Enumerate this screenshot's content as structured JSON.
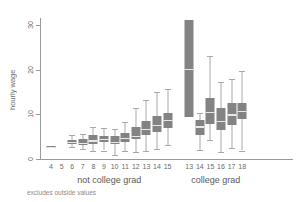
{
  "chart_data": {
    "type": "box",
    "title": "",
    "xlabel": "",
    "ylabel": "hourly wage",
    "ylim": [
      0,
      32
    ],
    "y_ticks": [
      0,
      10,
      20,
      30
    ],
    "grid": false,
    "legend": "none",
    "footnote": "excludes outside values",
    "group_labels": [
      "not college grad",
      "college grad"
    ],
    "groups": [
      {
        "name": "not college grad",
        "categories": [
          "4",
          "5",
          "6",
          "7",
          "8",
          "9",
          "10",
          "11",
          "12",
          "13",
          "14",
          "15"
        ],
        "boxes": [
          {
            "category": "4",
            "present": true,
            "whisker_low": 2.6,
            "q1": 2.6,
            "median": 2.7,
            "q3": 2.8,
            "whisker_high": 2.8
          },
          {
            "category": "5",
            "present": false,
            "whisker_low": null,
            "q1": null,
            "median": null,
            "q3": null,
            "whisker_high": null
          },
          {
            "category": "6",
            "present": true,
            "whisker_low": 2.7,
            "q1": 3.4,
            "median": 3.8,
            "q3": 4.3,
            "whisker_high": 5.3
          },
          {
            "category": "7",
            "present": true,
            "whisker_low": 2.3,
            "q1": 3.2,
            "median": 3.6,
            "q3": 4.4,
            "whisker_high": 5.6
          },
          {
            "category": "8",
            "present": true,
            "whisker_low": 1.8,
            "q1": 3.3,
            "median": 4.2,
            "q3": 5.4,
            "whisker_high": 7.2
          },
          {
            "category": "9",
            "present": true,
            "whisker_low": 1.9,
            "q1": 3.7,
            "median": 4.5,
            "q3": 5.2,
            "whisker_high": 6.9
          },
          {
            "category": "10",
            "present": true,
            "whisker_low": 1.0,
            "q1": 3.3,
            "median": 3.9,
            "q3": 5.1,
            "whisker_high": 6.6
          },
          {
            "category": "11",
            "present": true,
            "whisker_low": 1.7,
            "q1": 3.9,
            "median": 4.7,
            "q3": 5.9,
            "whisker_high": 8.2
          },
          {
            "category": "12",
            "present": true,
            "whisker_low": 1.6,
            "q1": 4.5,
            "median": 5.2,
            "q3": 7.2,
            "whisker_high": 11.5
          },
          {
            "category": "13",
            "present": true,
            "whisker_low": 1.7,
            "q1": 5.4,
            "median": 6.8,
            "q3": 8.6,
            "whisker_high": 13.2
          },
          {
            "category": "14",
            "present": true,
            "whisker_low": 2.3,
            "q1": 6.1,
            "median": 7.6,
            "q3": 9.7,
            "whisker_high": 14.9
          },
          {
            "category": "15",
            "present": true,
            "whisker_low": 3.1,
            "q1": 6.9,
            "median": 8.8,
            "q3": 10.3,
            "whisker_high": 15.6
          }
        ]
      },
      {
        "name": "college grad",
        "categories": [
          "13",
          "14",
          "15",
          "16",
          "17",
          "18"
        ],
        "boxes": [
          {
            "category": "13",
            "present": true,
            "whisker_low": 9.5,
            "q1": 9.5,
            "median": 20.2,
            "q3": 31.0,
            "whisker_high": 31.0
          },
          {
            "category": "14",
            "present": true,
            "whisker_low": 2.0,
            "q1": 5.4,
            "median": 7.3,
            "q3": 8.8,
            "whisker_high": 10.3
          },
          {
            "category": "15",
            "present": true,
            "whisker_low": 4.2,
            "q1": 7.8,
            "median": 10.6,
            "q3": 13.7,
            "whisker_high": 23.0
          },
          {
            "category": "16",
            "present": true,
            "whisker_low": 1.6,
            "q1": 6.5,
            "median": 8.6,
            "q3": 11.4,
            "whisker_high": 17.2
          },
          {
            "category": "17",
            "present": true,
            "whisker_low": 2.5,
            "q1": 7.6,
            "median": 10.0,
            "q3": 12.6,
            "whisker_high": 18.0
          },
          {
            "category": "18",
            "present": true,
            "whisker_low": 1.9,
            "q1": 8.9,
            "median": 10.8,
            "q3": 12.6,
            "whisker_high": 19.7
          }
        ]
      }
    ]
  },
  "colors": {
    "box_fill": "#838383",
    "whisker": "#a8a8a8",
    "median": "#e8e8e8",
    "axis": "#9a9a9a",
    "text": "#6b6b6b",
    "background": "#ffffff"
  }
}
